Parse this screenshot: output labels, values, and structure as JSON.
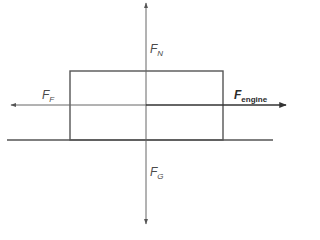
{
  "diagram": {
    "type": "free-body-diagram",
    "colors": {
      "line": "#555555",
      "thick_line": "#333333",
      "text": "#4a4a4a",
      "background": "#ffffff"
    },
    "forces": [
      {
        "id": "normal",
        "symbol": "F",
        "subscript": "N",
        "direction": "up"
      },
      {
        "id": "friction",
        "symbol": "F",
        "subscript": "F",
        "direction": "left"
      },
      {
        "id": "engine",
        "symbol": "F",
        "subscript": "engine",
        "direction": "right"
      },
      {
        "id": "gravity",
        "symbol": "F",
        "subscript": "G",
        "direction": "down"
      }
    ]
  }
}
